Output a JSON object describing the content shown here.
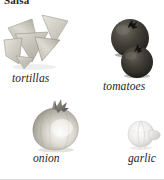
{
  "page": {
    "title": "Salsa",
    "background_color": "#ffffff",
    "width": 164,
    "height": 180
  },
  "figures": [
    {
      "id": "tortillas",
      "caption": "tortillas",
      "icon": "tortilla-chips-icon",
      "description": "pile of triangular tortilla chips",
      "color": "#c9c6bc"
    },
    {
      "id": "tomatoes",
      "caption": "tomatoes",
      "icon": "tomatoes-icon",
      "description": "two round dark tomatoes with stems",
      "color": "#3a3833"
    },
    {
      "id": "onion",
      "caption": "onion",
      "icon": "onion-icon",
      "description": "whole onion with dried neck",
      "color": "#b9b6ae"
    },
    {
      "id": "garlic",
      "caption": "garlic",
      "icon": "garlic-icon",
      "description": "pale garlic bulb with clove",
      "color": "#e3e2df"
    }
  ],
  "rule": {
    "bottom_border_color": "#d8d8d8"
  }
}
